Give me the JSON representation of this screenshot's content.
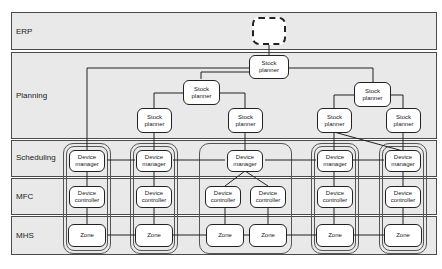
{
  "layers": [
    {
      "id": "erp",
      "label": "ERP"
    },
    {
      "id": "planning",
      "label": "Planning"
    },
    {
      "id": "scheduling",
      "label": "Scheduling"
    },
    {
      "id": "mfc",
      "label": "MFC"
    },
    {
      "id": "mhs",
      "label": "MHS"
    }
  ],
  "erp": {
    "external_system": ""
  },
  "planners": {
    "top": {
      "line1": "Stock",
      "line2": "planner"
    },
    "mid_left": {
      "line1": "Stock",
      "line2": "planner"
    },
    "mid_right": {
      "line1": "Stock",
      "line2": "planner"
    },
    "leaf_1": {
      "line1": "Stock",
      "line2": "planner"
    },
    "leaf_2": {
      "line1": "Stock",
      "line2": "planner"
    },
    "leaf_3": {
      "line1": "Stock",
      "line2": "planner"
    },
    "leaf_4": {
      "line1": "Stock",
      "line2": "planner"
    }
  },
  "device_managers": [
    {
      "line1": "Device",
      "line2": "manager"
    },
    {
      "line1": "Device",
      "line2": "manager"
    },
    {
      "line1": "Device",
      "line2": "manager"
    },
    {
      "line1": "Device",
      "line2": "manager"
    },
    {
      "line1": "Device",
      "line2": "manager"
    }
  ],
  "device_controllers": [
    {
      "line1": "Device",
      "line2": "controller"
    },
    {
      "line1": "Device",
      "line2": "controller"
    },
    {
      "line1": "Device",
      "line2": "controller"
    },
    {
      "line1": "Device",
      "line2": "controller"
    },
    {
      "line1": "Device",
      "line2": "controller"
    },
    {
      "line1": "Device",
      "line2": "controller"
    }
  ],
  "zones": [
    {
      "label": "Zone"
    },
    {
      "label": "Zone"
    },
    {
      "label": "Zone"
    },
    {
      "label": "Zone"
    },
    {
      "label": "Zone"
    },
    {
      "label": "Zone"
    }
  ],
  "colors": {
    "band_fill": "#e9e9e9",
    "node_fill": "#ffffff",
    "stroke": "#222222"
  }
}
